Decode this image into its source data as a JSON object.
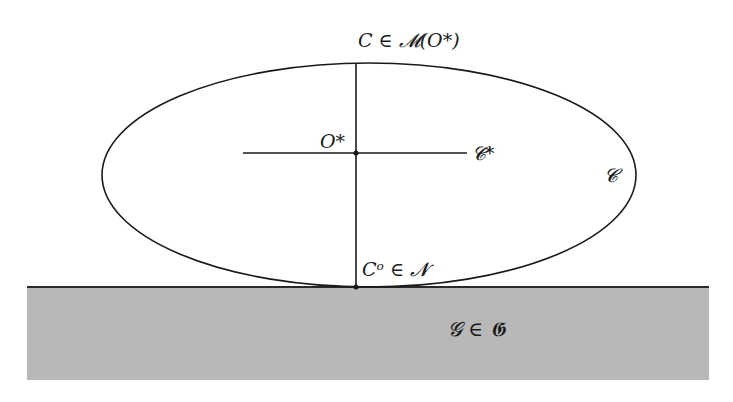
{
  "diagram": {
    "labels": {
      "top_point": "C ∈ 𝓜(O*)",
      "center": "O*",
      "horizontal_axis": "𝓒*",
      "ellipse": "𝓒",
      "contact_point": "Cᵒ ∈ 𝓝",
      "ground": "𝓖 ∈ 𝕲"
    },
    "colors": {
      "stroke": "#1a1a1a",
      "ground_fill": "#b8b8b8",
      "ground_edge": "#2a2a2a",
      "background": "#ffffff"
    }
  }
}
